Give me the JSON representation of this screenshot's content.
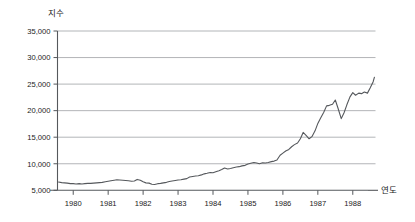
{
  "chart_data": {
    "type": "line",
    "title": "",
    "subtitle": "",
    "ylabel": "지수",
    "xlabel": "연도",
    "grid": "horizontal",
    "legend": "none",
    "ylim": [
      5000,
      35000
    ],
    "ytick_labels": [
      "35,000",
      "30,000",
      "25,000",
      "20,000",
      "15,000",
      "10,000",
      "5,000"
    ],
    "ytick_values": [
      35000,
      30000,
      25000,
      20000,
      15000,
      10000,
      5000
    ],
    "xlim": [
      1979.55,
      1988.65
    ],
    "xtick_labels": [
      "1980",
      "1981",
      "1982",
      "1983",
      "1984",
      "1985",
      "1986",
      "1987",
      "1988"
    ],
    "xtick_values": [
      1980,
      1981,
      1982,
      1983,
      1984,
      1985,
      1986,
      1987,
      1988
    ],
    "series": [
      {
        "name": "지수",
        "color": "#55585c",
        "x": [
          1979.58,
          1979.67,
          1979.75,
          1979.83,
          1979.92,
          1980.0,
          1980.08,
          1980.17,
          1980.25,
          1980.33,
          1980.42,
          1980.5,
          1980.58,
          1980.67,
          1980.75,
          1980.83,
          1980.92,
          1981.0,
          1981.08,
          1981.17,
          1981.25,
          1981.33,
          1981.42,
          1981.5,
          1981.58,
          1981.67,
          1981.75,
          1981.83,
          1981.92,
          1982.0,
          1982.08,
          1982.17,
          1982.25,
          1982.33,
          1982.42,
          1982.5,
          1982.58,
          1982.67,
          1982.75,
          1982.83,
          1982.92,
          1983.0,
          1983.08,
          1983.17,
          1983.25,
          1983.33,
          1983.42,
          1983.5,
          1983.58,
          1983.67,
          1983.75,
          1983.83,
          1983.92,
          1984.0,
          1984.08,
          1984.17,
          1984.25,
          1984.33,
          1984.42,
          1984.5,
          1984.58,
          1984.67,
          1984.75,
          1984.83,
          1984.92,
          1985.0,
          1985.08,
          1985.17,
          1985.25,
          1985.33,
          1985.42,
          1985.5,
          1985.58,
          1985.67,
          1985.75,
          1985.83,
          1985.92,
          1986.0,
          1986.08,
          1986.17,
          1986.25,
          1986.33,
          1986.42,
          1986.5,
          1986.58,
          1986.67,
          1986.75,
          1986.83,
          1986.92,
          1987.0,
          1987.08,
          1987.17,
          1987.25,
          1987.33,
          1987.42,
          1987.5,
          1987.58,
          1987.67,
          1987.75,
          1987.83,
          1987.92,
          1988.0,
          1988.08,
          1988.17,
          1988.25,
          1988.33,
          1988.42,
          1988.5,
          1988.58,
          1988.62
        ],
        "y": [
          6550,
          6450,
          6400,
          6350,
          6250,
          6250,
          6200,
          6250,
          6200,
          6250,
          6300,
          6300,
          6350,
          6400,
          6450,
          6500,
          6600,
          6700,
          6800,
          6900,
          7000,
          6950,
          6900,
          6850,
          6800,
          6700,
          6750,
          7050,
          6900,
          6600,
          6400,
          6350,
          6150,
          6100,
          6250,
          6300,
          6400,
          6500,
          6650,
          6750,
          6850,
          6950,
          7000,
          7100,
          7200,
          7500,
          7600,
          7700,
          7750,
          7900,
          8100,
          8200,
          8350,
          8300,
          8500,
          8700,
          8900,
          9200,
          9000,
          9100,
          9250,
          9400,
          9450,
          9600,
          9700,
          9950,
          10100,
          10250,
          10150,
          10000,
          10200,
          10150,
          10250,
          10400,
          10500,
          10700,
          11600,
          12000,
          12400,
          12700,
          13200,
          13600,
          13900,
          14700,
          15900,
          15300,
          14700,
          15100,
          16200,
          17600,
          18600,
          19700,
          20900,
          21000,
          21200,
          22000,
          20400,
          18500,
          19600,
          21100,
          22600,
          23400,
          22900,
          23300,
          23200,
          23500,
          23300,
          24300,
          25400,
          26300
        ]
      }
    ]
  },
  "annotations": {
    "ylabel_display": "지수",
    "xlabel_display": "연도"
  }
}
